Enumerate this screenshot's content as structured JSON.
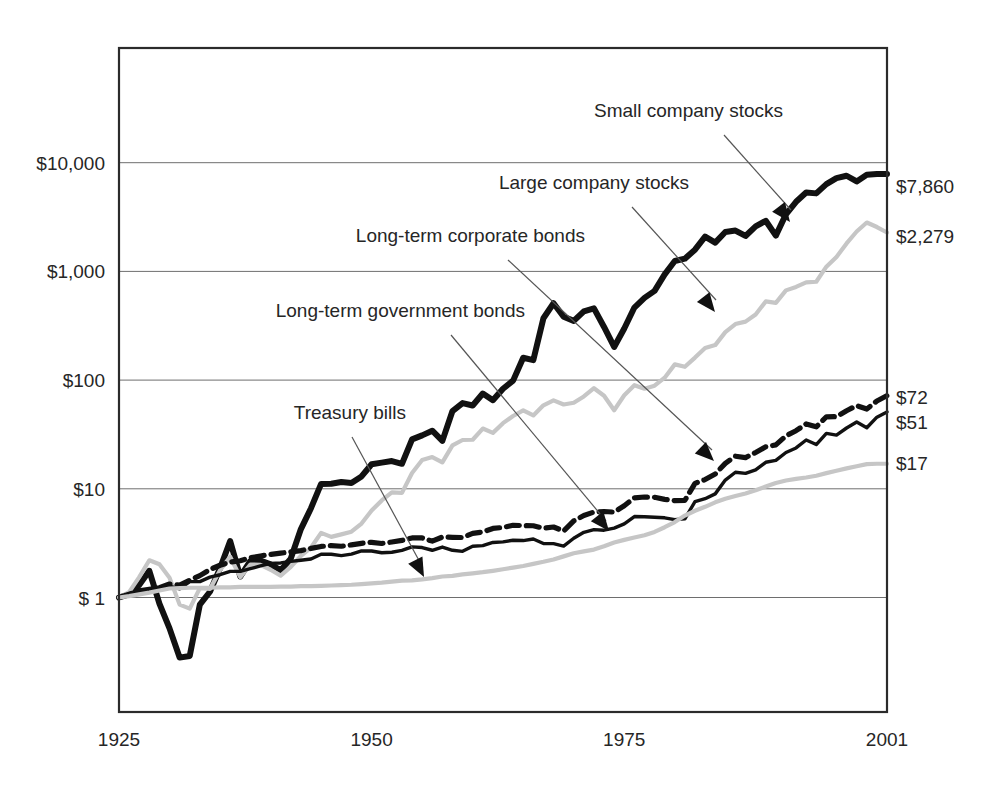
{
  "chart_data": {
    "type": "line",
    "title": "",
    "subtitle": "",
    "xlabel": "",
    "ylabel": "",
    "scale": "log",
    "grid": true,
    "legend_position": "inline-annotations",
    "xlim": [
      1925,
      2001
    ],
    "ylim": [
      0.1,
      40000
    ],
    "x_ticks": [
      "1925",
      "1950",
      "1975",
      "2001"
    ],
    "x_tick_values": [
      1925,
      1950,
      1975,
      2001
    ],
    "y_ticks": [
      "$ 1",
      "$10",
      "$100",
      "$1,000",
      "$10,000"
    ],
    "y_tick_values": [
      1,
      10,
      100,
      1000,
      10000
    ],
    "end_labels": [
      {
        "series": "Small company stocks",
        "text": "$7,860",
        "value": 7860
      },
      {
        "series": "Large company stocks",
        "text": "$2,279",
        "value": 2279
      },
      {
        "series": "Long-term corporate bonds",
        "text": "$72",
        "value": 72
      },
      {
        "series": "Long-term government bonds",
        "text": "$51",
        "value": 51
      },
      {
        "series": "Treasury bills",
        "text": "$17",
        "value": 17
      }
    ],
    "annotations": [
      {
        "label": "Small company stocks",
        "anchor": "end"
      },
      {
        "label": "Large company stocks",
        "anchor": "end"
      },
      {
        "label": "Long-term corporate bonds",
        "anchor": "end"
      },
      {
        "label": "Long-term government bonds",
        "anchor": "end"
      },
      {
        "label": "Treasury bills",
        "anchor": "end"
      }
    ],
    "x": [
      1925,
      1926,
      1927,
      1928,
      1929,
      1930,
      1931,
      1932,
      1933,
      1934,
      1935,
      1936,
      1937,
      1938,
      1939,
      1940,
      1941,
      1942,
      1943,
      1944,
      1945,
      1946,
      1947,
      1948,
      1949,
      1950,
      1951,
      1952,
      1953,
      1954,
      1955,
      1956,
      1957,
      1958,
      1959,
      1960,
      1961,
      1962,
      1963,
      1964,
      1965,
      1966,
      1967,
      1968,
      1969,
      1970,
      1971,
      1972,
      1973,
      1974,
      1975,
      1976,
      1977,
      1978,
      1979,
      1980,
      1981,
      1982,
      1983,
      1984,
      1985,
      1986,
      1987,
      1988,
      1989,
      1990,
      1991,
      1992,
      1993,
      1994,
      1995,
      1996,
      1997,
      1998,
      1999,
      2000,
      2001
    ],
    "series": [
      {
        "name": "Small company stocks",
        "style": "thick-solid-black",
        "color": "#111111",
        "final_value": 7860,
        "values": [
          1,
          1.07,
          1.3,
          1.76,
          0.88,
          0.52,
          0.28,
          0.29,
          0.86,
          1.13,
          1.86,
          3.3,
          1.56,
          2.17,
          2.19,
          2.02,
          1.78,
          2.28,
          4.26,
          6.63,
          11.09,
          11.14,
          11.56,
          11.31,
          12.99,
          16.82,
          17.41,
          18.01,
          16.98,
          28.49,
          30.99,
          34.21,
          27.59,
          51.92,
          61.43,
          58.44,
          75.25,
          65.37,
          83.28,
          98.95,
          160.6,
          152.65,
          370.38,
          509.79,
          382.28,
          350.48,
          429.41,
          457.54,
          308.28,
          201.84,
          298.74,
          465.02,
          570.91,
          661.91,
          940.06,
          1247.23,
          1310.49,
          1584.13,
          2091.47,
          1841.06,
          2304.01,
          2376.51,
          2117.69,
          2595.93,
          2920.41,
          2135.25,
          3352.09,
          4366.82,
          5327.53,
          5221.16,
          6348.0,
          7215.3,
          7583.16,
          6721.52,
          7735.8,
          7860.0,
          7860.0
        ]
      },
      {
        "name": "Large company stocks",
        "style": "thin-solid-gray",
        "color": "#c6c6c6",
        "final_value": 2279,
        "values": [
          1,
          1.12,
          1.54,
          2.2,
          2.02,
          1.52,
          0.86,
          0.79,
          1.22,
          1.2,
          1.78,
          2.37,
          1.54,
          2.01,
          2.0,
          1.8,
          1.59,
          1.91,
          2.41,
          2.88,
          3.93,
          3.61,
          3.81,
          4.03,
          4.79,
          6.31,
          7.82,
          9.26,
          9.17,
          13.99,
          18.39,
          19.6,
          17.5,
          25.11,
          28.11,
          28.25,
          35.83,
          32.7,
          40.17,
          46.75,
          52.57,
          47.29,
          58.63,
          65.12,
          59.61,
          61.94,
          70.79,
          84.22,
          71.87,
          52.84,
          72.5,
          89.81,
          83.38,
          88.87,
          105.27,
          139.48,
          132.62,
          161.14,
          197.5,
          209.9,
          276.43,
          327.75,
          344.9,
          402.04,
          529.48,
          512.93,
          669.06,
          719.98,
          792.44,
          802.84,
          1104.7,
          1358.17,
          1810.58,
          2328.6,
          2817.0,
          2559.0,
          2279.0
        ]
      },
      {
        "name": "Long-term corporate bonds",
        "style": "dashed-black",
        "color": "#111111",
        "final_value": 72,
        "values": [
          1,
          1.07,
          1.15,
          1.19,
          1.23,
          1.33,
          1.3,
          1.44,
          1.59,
          1.81,
          1.98,
          2.12,
          2.18,
          2.32,
          2.41,
          2.49,
          2.56,
          2.63,
          2.7,
          2.83,
          2.95,
          3.0,
          2.96,
          3.05,
          3.15,
          3.22,
          3.14,
          3.24,
          3.35,
          3.53,
          3.53,
          3.3,
          3.6,
          3.58,
          3.56,
          3.89,
          4.01,
          4.32,
          4.41,
          4.62,
          4.58,
          4.57,
          4.34,
          4.45,
          4.09,
          5.07,
          5.68,
          6.11,
          6.18,
          6.1,
          6.99,
          8.26,
          8.4,
          8.35,
          8.0,
          7.77,
          7.84,
          11.23,
          12.16,
          13.67,
          17.14,
          19.95,
          19.38,
          21.56,
          24.33,
          25.33,
          30.67,
          34.24,
          39.49,
          37.17,
          45.98,
          46.15,
          52.3,
          58.27,
          54.16,
          64.26,
          72.0
        ]
      },
      {
        "name": "Long-term government bonds",
        "style": "thin-solid-black",
        "color": "#111111",
        "final_value": 51,
        "values": [
          1,
          1.08,
          1.17,
          1.17,
          1.21,
          1.27,
          1.2,
          1.4,
          1.4,
          1.54,
          1.62,
          1.74,
          1.74,
          1.84,
          1.95,
          2.06,
          2.08,
          2.15,
          2.2,
          2.26,
          2.5,
          2.5,
          2.43,
          2.51,
          2.68,
          2.68,
          2.58,
          2.61,
          2.71,
          2.92,
          2.88,
          2.72,
          2.91,
          2.72,
          2.66,
          2.96,
          3.0,
          3.21,
          3.25,
          3.36,
          3.34,
          3.45,
          3.14,
          3.13,
          2.97,
          3.51,
          3.98,
          4.21,
          4.16,
          4.35,
          4.76,
          5.56,
          5.54,
          5.47,
          5.41,
          5.2,
          5.3,
          7.62,
          8.11,
          8.98,
          12.02,
          14.19,
          13.85,
          14.92,
          17.54,
          18.23,
          21.58,
          23.77,
          28.1,
          25.52,
          32.36,
          31.22,
          36.25,
          41.09,
          36.42,
          45.6,
          51.0
        ]
      },
      {
        "name": "Treasury bills",
        "style": "thin-solid-gray",
        "color": "#c6c6c6",
        "final_value": 17,
        "values": [
          1,
          1.03,
          1.07,
          1.11,
          1.16,
          1.21,
          1.22,
          1.23,
          1.23,
          1.23,
          1.24,
          1.24,
          1.25,
          1.25,
          1.25,
          1.25,
          1.26,
          1.26,
          1.27,
          1.27,
          1.28,
          1.29,
          1.3,
          1.31,
          1.33,
          1.35,
          1.37,
          1.4,
          1.43,
          1.44,
          1.47,
          1.51,
          1.56,
          1.58,
          1.63,
          1.67,
          1.71,
          1.76,
          1.82,
          1.88,
          1.95,
          2.04,
          2.13,
          2.24,
          2.39,
          2.55,
          2.66,
          2.76,
          2.96,
          3.2,
          3.39,
          3.56,
          3.74,
          4.01,
          4.43,
          4.94,
          5.67,
          6.28,
          6.83,
          7.51,
          8.09,
          8.59,
          9.06,
          9.68,
          10.49,
          11.3,
          11.93,
          12.35,
          12.71,
          13.19,
          13.93,
          14.64,
          15.41,
          16.13,
          16.88,
          17.0,
          17.0
        ]
      }
    ]
  }
}
